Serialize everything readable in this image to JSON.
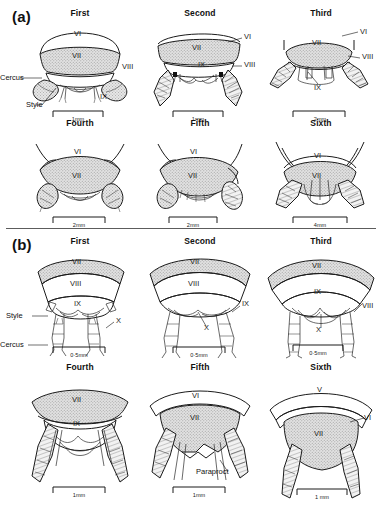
{
  "figure": {
    "panels": [
      {
        "letter": "(a)",
        "rows": [
          {
            "cells": [
              {
                "title": "First",
                "segment_labels": [
                  "VI",
                  "VII",
                  "VIII",
                  "IX"
                ],
                "annotations": [
                  "Cercus",
                  "Style"
                ],
                "scale": "1mm"
              },
              {
                "title": "Second",
                "segment_labels": [
                  "VI",
                  "VII",
                  "VIII",
                  "IX"
                ],
                "annotations": [],
                "scale": "1mm"
              },
              {
                "title": "Third",
                "segment_labels": [
                  "VI",
                  "VII",
                  "VIII",
                  "IX"
                ],
                "annotations": [],
                "scale": "2mm"
              }
            ]
          },
          {
            "cells": [
              {
                "title": "Fourth",
                "segment_labels": [
                  "VI",
                  "VII"
                ],
                "annotations": [],
                "scale": "2mm"
              },
              {
                "title": "Fifth",
                "segment_labels": [
                  "VI",
                  "VII"
                ],
                "annotations": [],
                "scale": "2mm"
              },
              {
                "title": "Sixth",
                "segment_labels": [
                  "VI",
                  "VII"
                ],
                "annotations": [],
                "scale": "4mm"
              }
            ]
          }
        ]
      },
      {
        "letter": "(b)",
        "rows": [
          {
            "cells": [
              {
                "title": "First",
                "segment_labels": [
                  "VII",
                  "VIII",
                  "IX",
                  "X"
                ],
                "annotations": [
                  "Style",
                  "Cercus"
                ],
                "scale": "0·5mm"
              },
              {
                "title": "Second",
                "segment_labels": [
                  "VII",
                  "VIII",
                  "IX",
                  "X"
                ],
                "annotations": [],
                "scale": "0·5mm"
              },
              {
                "title": "Third",
                "segment_labels": [
                  "VII",
                  "VIII",
                  "IX",
                  "X"
                ],
                "annotations": [],
                "scale": "0·5mm"
              }
            ]
          },
          {
            "cells": [
              {
                "title": "Fourth",
                "segment_labels": [
                  "VII",
                  "IX"
                ],
                "annotations": [],
                "scale": "1mm"
              },
              {
                "title": "Fifth",
                "segment_labels": [
                  "VI",
                  "VII"
                ],
                "annotations": [
                  "Paraproct"
                ],
                "scale": "1mm"
              },
              {
                "title": "Sixth",
                "segment_labels": [
                  "V",
                  "VI",
                  "VII"
                ],
                "annotations": [],
                "scale": "1 mm"
              }
            ]
          }
        ]
      }
    ]
  },
  "style": {
    "ink": "#1b1b1b",
    "hatch_fill": "#d9d9d9",
    "background": "#ffffff"
  }
}
